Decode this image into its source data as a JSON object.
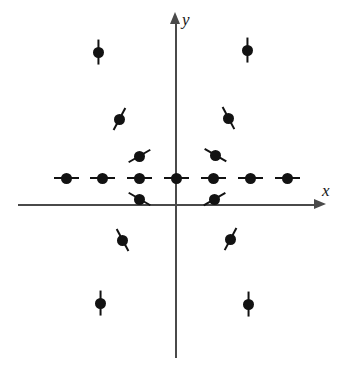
{
  "figure": {
    "background_color": "#ffffff",
    "marker_color": "#121212",
    "axis_color": "#4a4a4a",
    "width": 342,
    "height": 379
  },
  "axes": {
    "x": {
      "label": "x",
      "orientation": "horizontal",
      "arrow_direction": "right",
      "y_position": 205,
      "start_x": 18,
      "end_x": 326
    },
    "y": {
      "label": "y",
      "orientation": "vertical",
      "arrow_direction": "up",
      "x_position": 176,
      "start_y": 12,
      "end_y": 358
    },
    "origin": {
      "x": 176,
      "y": 178
    }
  },
  "chart_data": {
    "type": "scatter",
    "xlabel": "x",
    "ylabel": "y",
    "grid": false,
    "legend": null,
    "marker_style": "filled-dot-with-directional-stem",
    "series": [
      {
        "name": "spins",
        "count": 19,
        "points": [
          {
            "id": "spin-top-left",
            "x": 98,
            "y": 52,
            "angle_deg": 90,
            "stem": "vertical"
          },
          {
            "id": "spin-top-right",
            "x": 247,
            "y": 50,
            "angle_deg": 90,
            "stem": "vertical"
          },
          {
            "id": "spin-upper-left-mid",
            "x": 119,
            "y": 119,
            "angle_deg": 62,
            "stem": "diagonal"
          },
          {
            "id": "spin-upper-right-mid",
            "x": 228,
            "y": 118,
            "angle_deg": 118,
            "stem": "diagonal"
          },
          {
            "id": "spin-upper-left-inner",
            "x": 139,
            "y": 156,
            "angle_deg": 30,
            "stem": "diagonal"
          },
          {
            "id": "spin-upper-right-inner",
            "x": 215,
            "y": 155,
            "angle_deg": 150,
            "stem": "diagonal"
          },
          {
            "id": "spin-row-1",
            "x": 66,
            "y": 178,
            "angle_deg": 0,
            "stem": "horizontal"
          },
          {
            "id": "spin-row-2",
            "x": 102,
            "y": 178,
            "angle_deg": 0,
            "stem": "horizontal"
          },
          {
            "id": "spin-row-3",
            "x": 139,
            "y": 178,
            "angle_deg": 0,
            "stem": "horizontal"
          },
          {
            "id": "spin-row-origin",
            "x": 176,
            "y": 178,
            "angle_deg": 0,
            "stem": "horizontal"
          },
          {
            "id": "spin-row-5",
            "x": 213,
            "y": 178,
            "angle_deg": 0,
            "stem": "horizontal"
          },
          {
            "id": "spin-row-6",
            "x": 250,
            "y": 178,
            "angle_deg": 0,
            "stem": "horizontal"
          },
          {
            "id": "spin-row-7",
            "x": 287,
            "y": 178,
            "angle_deg": 0,
            "stem": "horizontal"
          },
          {
            "id": "spin-lower-left-inner",
            "x": 139,
            "y": 199,
            "angle_deg": -30,
            "stem": "diagonal"
          },
          {
            "id": "spin-lower-right-inner",
            "x": 214,
            "y": 199,
            "angle_deg": -150,
            "stem": "diagonal"
          },
          {
            "id": "spin-lower-left-mid",
            "x": 122,
            "y": 240,
            "angle_deg": -62,
            "stem": "diagonal"
          },
          {
            "id": "spin-lower-right-mid",
            "x": 230,
            "y": 239,
            "angle_deg": -118,
            "stem": "diagonal"
          },
          {
            "id": "spin-bottom-left",
            "x": 100,
            "y": 303,
            "angle_deg": -90,
            "stem": "vertical"
          },
          {
            "id": "spin-bottom-right",
            "x": 248,
            "y": 304,
            "angle_deg": -90,
            "stem": "vertical"
          }
        ]
      }
    ]
  }
}
